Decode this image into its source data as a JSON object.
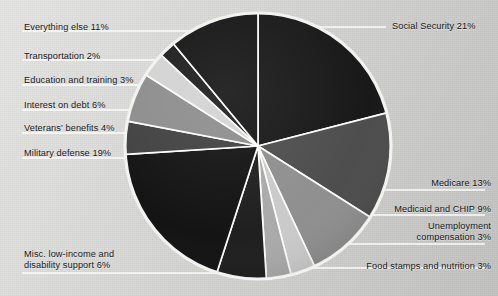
{
  "chart_data": {
    "type": "pie",
    "title": "",
    "subtitle": "",
    "xlabel": "",
    "ylabel": "",
    "legend_position": "callout-labels",
    "grid": false,
    "start_angle_deg": 0,
    "direction": "clockwise",
    "total_percent": 100,
    "units": "percent of federal budget",
    "categories": [
      "Social Security",
      "Medicare",
      "Medicaid and CHIP",
      "Unemployment compensation",
      "Food stamps and nutrition",
      "Misc. low-income and disability support",
      "Military defense",
      "Veterans' benefits",
      "Interest on debt",
      "Education and training",
      "Transportation",
      "Everything else"
    ],
    "values": [
      21,
      13,
      9,
      3,
      3,
      6,
      19,
      4,
      6,
      3,
      2,
      11
    ],
    "labels": [
      "Social Security 21%",
      "Medicare 13%",
      "Medicaid and CHIP 9%",
      "Unemployment\ncompensation 3%",
      "Food stamps and nutrition 3%",
      "Misc. low-income and\ndisability support 6%",
      "Military defense 19%",
      "Veterans' benefits 4%",
      "Interest on debt 6%",
      "Education and training 3%",
      "Transportation 2%",
      "Everything else 11%"
    ],
    "colors": [
      "#141414",
      "#4a4a4a",
      "#8d8d8d",
      "#c9c9c9",
      "#a8a8a8",
      "#1b1b1b",
      "#0f0f0f",
      "#3e3e3e",
      "#8b8b8b",
      "#d2d2d2",
      "#1a1a1a",
      "#121212"
    ]
  },
  "figure": {
    "background_color": "#d9d9d7",
    "pie_outline_color": "#f2f2f0",
    "slice_divider_color": "#fbfbf9",
    "leader_line_color": "#fbfbf9",
    "text_color": "#16181a",
    "center_x": 258,
    "center_y": 146,
    "radius": 133
  },
  "callouts": [
    {
      "name": "social-security",
      "text": "Social Security 21%",
      "align": "left",
      "x": 392,
      "y": 21,
      "line": [
        [
          303,
          27
        ],
        [
          386,
          27
        ]
      ]
    },
    {
      "name": "medicare",
      "text": "Medicare 13%",
      "align": "right",
      "x": 491,
      "y": 178,
      "line": [
        [
          352,
          190
        ],
        [
          485,
          190
        ]
      ]
    },
    {
      "name": "medicaid-chip",
      "text": "Medicaid and CHIP 9%",
      "align": "right",
      "x": 491,
      "y": 204,
      "line": [
        [
          318,
          215
        ],
        [
          485,
          215
        ]
      ]
    },
    {
      "name": "unemployment-compensation",
      "text": "Unemployment\ncompensation 3%",
      "align": "right",
      "x": 491,
      "y": 221,
      "line": [
        [
          291,
          244
        ],
        [
          485,
          244
        ]
      ]
    },
    {
      "name": "food-stamps-nutrition",
      "text": "Food stamps and nutrition 3%",
      "align": "right",
      "x": 491,
      "y": 261,
      "line": [
        [
          264,
          268
        ],
        [
          485,
          268
        ]
      ]
    },
    {
      "name": "misc-low-income",
      "text": "Misc. low-income and\ndisability support 6%",
      "align": "left",
      "x": 24,
      "y": 249,
      "line": [
        [
          22,
          273
        ],
        [
          237,
          273
        ]
      ]
    },
    {
      "name": "military-defense",
      "text": "Military defense 19%",
      "align": "left",
      "x": 24,
      "y": 148,
      "line": [
        [
          22,
          158
        ],
        [
          149,
          158
        ]
      ]
    },
    {
      "name": "veterans-benefits",
      "text": "Veterans' benefits 4%",
      "align": "left",
      "x": 24,
      "y": 123,
      "line": [
        [
          22,
          133
        ],
        [
          136,
          133
        ]
      ]
    },
    {
      "name": "interest-on-debt",
      "text": "Interest on debt 6%",
      "align": "left",
      "x": 24,
      "y": 100,
      "line": [
        [
          22,
          110
        ],
        [
          145,
          110
        ]
      ]
    },
    {
      "name": "education-and-training",
      "text": "Education and training 3%",
      "align": "left",
      "x": 24,
      "y": 75,
      "line": [
        [
          22,
          85
        ],
        [
          180,
          85
        ]
      ]
    },
    {
      "name": "transportation",
      "text": "Transportation 2%",
      "align": "left",
      "x": 24,
      "y": 51,
      "line": [
        [
          22,
          60
        ],
        [
          172,
          60
        ]
      ]
    },
    {
      "name": "everything-else",
      "text": "Everything else 11%",
      "align": "left",
      "x": 24,
      "y": 22,
      "line": [
        [
          22,
          31
        ],
        [
          213,
          31
        ]
      ]
    }
  ]
}
